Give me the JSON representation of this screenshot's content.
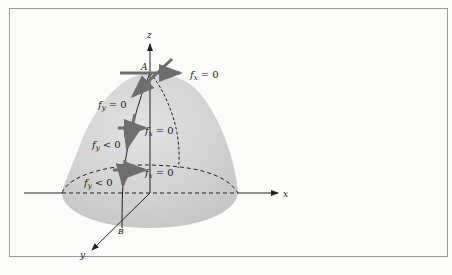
{
  "figure": {
    "type": "3d-surface-diagram",
    "surface": "paraboloid (dome)",
    "colors": {
      "surface_fill": "#cfcfcf",
      "surface_highlight": "#e4e4e4",
      "axis": "#222222",
      "tangent_arrows": "#6e6e6e",
      "background": "#fbfbfa",
      "frame": "#9a9a9a"
    },
    "axes": {
      "x": "x",
      "y": "y",
      "z": "z"
    },
    "points": {
      "A": "A",
      "B": "B"
    },
    "labels": {
      "fx_top": {
        "var": "f",
        "sub": "x",
        "rel": "= 0"
      },
      "fy_top": {
        "var": "f",
        "sub": "y",
        "rel": "= 0"
      },
      "fx_mid": {
        "var": "f",
        "sub": "x",
        "rel": "= 0"
      },
      "fy_mid": {
        "var": "f",
        "sub": "y",
        "rel": "< 0"
      },
      "fx_low": {
        "var": "f",
        "sub": "x",
        "rel": "= 0"
      },
      "fy_low": {
        "var": "f",
        "sub": "y",
        "rel": "< 0"
      }
    }
  }
}
